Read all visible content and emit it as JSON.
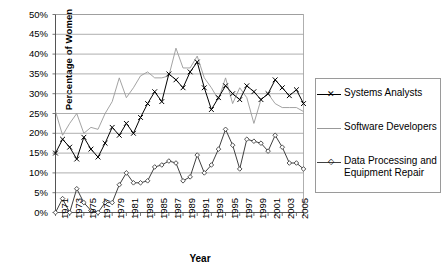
{
  "chart_data": {
    "type": "line",
    "title": "",
    "xlabel": "Year",
    "ylabel": "Percentage of Women",
    "ylim": [
      0,
      50
    ],
    "yticks": [
      "0%",
      "5%",
      "10%",
      "15%",
      "20%",
      "25%",
      "30%",
      "35%",
      "40%",
      "45%",
      "50%"
    ],
    "ytick_values": [
      0,
      5,
      10,
      15,
      20,
      25,
      30,
      35,
      40,
      45,
      50
    ],
    "xlim": [
      1971,
      2006
    ],
    "grid": "horizontal",
    "legend_position": "right",
    "x": [
      1971,
      1972,
      1973,
      1974,
      1975,
      1976,
      1977,
      1978,
      1979,
      1980,
      1981,
      1982,
      1983,
      1984,
      1985,
      1986,
      1987,
      1988,
      1989,
      1990,
      1991,
      1992,
      1993,
      1994,
      1995,
      1996,
      1997,
      1998,
      1999,
      2000,
      2001,
      2002,
      2003,
      2004,
      2005,
      2006
    ],
    "xtick_labels": [
      "1971",
      "1973",
      "1975",
      "1977",
      "1979",
      "1981",
      "1983",
      "1985",
      "1987",
      "1989",
      "1991",
      "1993",
      "1995",
      "1997",
      "1999",
      "2001",
      "2003",
      "2005"
    ],
    "series": [
      {
        "name": "Systems Analysts",
        "marker": "x",
        "color": "#000000",
        "values": [
          15.0,
          18.5,
          16.5,
          13.5,
          19.0,
          16.0,
          14.0,
          17.5,
          21.5,
          19.5,
          22.5,
          20.0,
          24.0,
          27.5,
          30.5,
          28.0,
          35.0,
          33.5,
          31.5,
          35.5,
          38.0,
          31.5,
          26.0,
          29.0,
          32.0,
          30.0,
          28.5,
          32.0,
          30.5,
          28.5,
          30.0,
          33.5,
          31.5,
          29.5,
          31.0,
          27.5
        ]
      },
      {
        "name": "Software Developers",
        "marker": "none",
        "color": "#999999",
        "values": [
          25.5,
          19.5,
          22.5,
          25.0,
          20.0,
          21.5,
          21.0,
          25.0,
          28.0,
          34.0,
          29.0,
          31.5,
          34.5,
          35.5,
          34.0,
          34.0,
          34.5,
          41.5,
          36.5,
          36.5,
          39.5,
          34.0,
          31.5,
          28.5,
          34.0,
          27.5,
          31.5,
          29.0,
          22.5,
          28.5,
          30.0,
          27.5,
          26.5,
          26.5,
          26.5,
          25.5
        ]
      },
      {
        "name": "Data Processing and Equipment Repair",
        "marker": "diamond",
        "color": "#404040",
        "values": [
          0.0,
          3.5,
          0.0,
          6.0,
          2.5,
          0.5,
          0.0,
          2.5,
          2.5,
          7.0,
          10.0,
          7.5,
          7.5,
          8.0,
          11.5,
          12.0,
          13.0,
          12.5,
          8.0,
          9.0,
          14.5,
          10.0,
          12.0,
          16.0,
          21.0,
          17.0,
          11.0,
          18.5,
          18.0,
          17.5,
          15.5,
          19.5,
          16.5,
          12.5,
          12.5,
          11.0
        ]
      }
    ]
  },
  "legend": {
    "items": [
      {
        "label": "Systems Analysts"
      },
      {
        "label": "Software Developers"
      },
      {
        "label": "Data Processing and Equipment Repair"
      }
    ]
  }
}
